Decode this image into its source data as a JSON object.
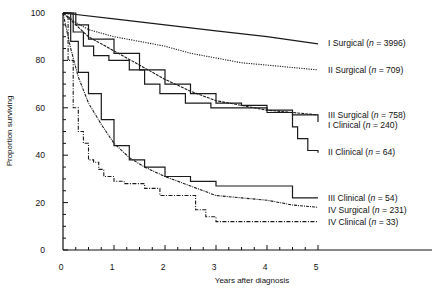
{
  "chart_data": {
    "type": "line",
    "title": "",
    "xlabel": "Years after diagnosis",
    "ylabel": "Proportion surviving",
    "xlim": [
      0,
      5
    ],
    "ylim": [
      0,
      100
    ],
    "x_ticks": [
      "0",
      "1",
      "2",
      "3",
      "4",
      "5"
    ],
    "y_ticks": [
      "0",
      "20",
      "40",
      "60",
      "80",
      "100"
    ],
    "grid": false,
    "legend_position": "inline-right",
    "series": [
      {
        "name": "I Surgical",
        "n": "3996",
        "style": "solid",
        "step": false,
        "points": [
          [
            0,
            100
          ],
          [
            1,
            97.5
          ],
          [
            2,
            95
          ],
          [
            3,
            92.5
          ],
          [
            4,
            90
          ],
          [
            5,
            87
          ]
        ]
      },
      {
        "name": "II Surgical",
        "n": "709",
        "style": "dotted",
        "step": false,
        "points": [
          [
            0,
            100
          ],
          [
            0.25,
            96
          ],
          [
            0.5,
            93
          ],
          [
            1,
            90
          ],
          [
            1.5,
            88
          ],
          [
            2,
            86
          ],
          [
            2.5,
            83
          ],
          [
            3,
            81
          ],
          [
            3.5,
            79
          ],
          [
            4,
            78
          ],
          [
            4.5,
            77
          ],
          [
            5,
            76
          ]
        ]
      },
      {
        "name": "III Surgical",
        "n": "758",
        "style": "dashed-fine",
        "step": false,
        "points": [
          [
            0,
            100
          ],
          [
            0.25,
            95
          ],
          [
            0.5,
            90
          ],
          [
            1,
            84
          ],
          [
            1.5,
            78
          ],
          [
            2,
            72
          ],
          [
            2.5,
            67
          ],
          [
            3,
            63
          ],
          [
            3.5,
            61
          ],
          [
            4,
            59
          ],
          [
            4.5,
            58
          ],
          [
            5,
            57
          ]
        ]
      },
      {
        "name": "I Clinical",
        "n": "240",
        "style": "solid",
        "step": true,
        "points": [
          [
            0,
            100
          ],
          [
            0.25,
            95
          ],
          [
            0.5,
            89
          ],
          [
            1,
            83
          ],
          [
            1.5,
            76
          ],
          [
            2,
            70
          ],
          [
            2.5,
            66
          ],
          [
            3,
            62
          ],
          [
            3.5,
            61
          ],
          [
            4,
            59
          ],
          [
            4.5,
            57
          ],
          [
            5,
            54
          ]
        ]
      },
      {
        "name": "II Clinical",
        "n": "64",
        "style": "solid",
        "step": true,
        "points": [
          [
            0,
            100
          ],
          [
            0.2,
            92
          ],
          [
            0.4,
            86
          ],
          [
            0.6,
            82
          ],
          [
            0.9,
            80
          ],
          [
            1.3,
            76
          ],
          [
            1.6,
            70
          ],
          [
            1.9,
            66
          ],
          [
            2.4,
            62
          ],
          [
            2.9,
            60
          ],
          [
            3.3,
            60
          ],
          [
            4.0,
            58
          ],
          [
            4.5,
            52
          ],
          [
            4.6,
            47
          ],
          [
            4.8,
            42
          ],
          [
            5,
            41
          ]
        ]
      },
      {
        "name": "III Clinical",
        "n": "54",
        "style": "solid",
        "step": true,
        "points": [
          [
            0,
            100
          ],
          [
            0.15,
            88
          ],
          [
            0.3,
            75
          ],
          [
            0.5,
            66
          ],
          [
            0.75,
            55
          ],
          [
            1,
            44
          ],
          [
            1.3,
            38
          ],
          [
            1.6,
            35
          ],
          [
            2,
            31
          ],
          [
            2.5,
            29
          ],
          [
            3,
            27
          ],
          [
            3.5,
            27
          ],
          [
            4,
            27
          ],
          [
            4.4,
            27
          ],
          [
            4.5,
            22
          ],
          [
            5,
            22
          ]
        ]
      },
      {
        "name": "IV Surgical",
        "n": "231",
        "style": "dash-dot-fine",
        "step": false,
        "points": [
          [
            0,
            100
          ],
          [
            0.15,
            85
          ],
          [
            0.3,
            73
          ],
          [
            0.5,
            62
          ],
          [
            0.75,
            53
          ],
          [
            1,
            45
          ],
          [
            1.3,
            39
          ],
          [
            1.6,
            35
          ],
          [
            2,
            31
          ],
          [
            2.5,
            27
          ],
          [
            3,
            23
          ],
          [
            3.5,
            22
          ],
          [
            4,
            21
          ],
          [
            4.5,
            19
          ],
          [
            5,
            18
          ]
        ]
      },
      {
        "name": "IV Clinical",
        "n": "33",
        "style": "dash-dot",
        "step": true,
        "points": [
          [
            0,
            100
          ],
          [
            0.1,
            80
          ],
          [
            0.2,
            60
          ],
          [
            0.3,
            50
          ],
          [
            0.4,
            45
          ],
          [
            0.5,
            38
          ],
          [
            0.6,
            37
          ],
          [
            0.7,
            34
          ],
          [
            0.8,
            31
          ],
          [
            1,
            29
          ],
          [
            1.2,
            28
          ],
          [
            1.6,
            26
          ],
          [
            1.9,
            23
          ],
          [
            2.5,
            23
          ],
          [
            2.6,
            17
          ],
          [
            2.8,
            14
          ],
          [
            3.0,
            12
          ],
          [
            5,
            12
          ]
        ]
      }
    ]
  },
  "labels": {
    "xlabel": "Years after diagnosis",
    "ylabel": "Proportion surviving"
  }
}
